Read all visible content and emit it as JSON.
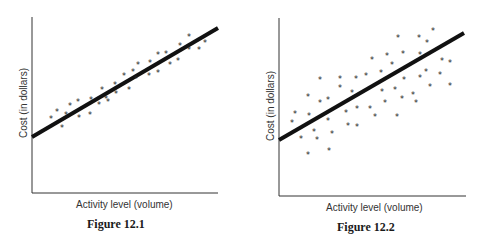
{
  "chart_data": [
    {
      "type": "scatter",
      "title": "Figure 12.1",
      "xlabel": "Activity level (volume)",
      "ylabel": "Cost (in dollars)",
      "grid": false,
      "legend": null,
      "description": "Tightly clustered points around a strong positive linear regression line",
      "regression_line": {
        "x": [
          0,
          100
        ],
        "y": [
          32,
          94
        ]
      },
      "points": [
        {
          "x": 10,
          "y": 43
        },
        {
          "x": 14,
          "y": 47
        },
        {
          "x": 16,
          "y": 38
        },
        {
          "x": 18,
          "y": 45
        },
        {
          "x": 20,
          "y": 50
        },
        {
          "x": 25,
          "y": 52
        },
        {
          "x": 25,
          "y": 43
        },
        {
          "x": 31,
          "y": 45
        },
        {
          "x": 32,
          "y": 53
        },
        {
          "x": 36,
          "y": 51
        },
        {
          "x": 38,
          "y": 59
        },
        {
          "x": 40,
          "y": 54
        },
        {
          "x": 41,
          "y": 52
        },
        {
          "x": 45,
          "y": 62
        },
        {
          "x": 45,
          "y": 57
        },
        {
          "x": 49,
          "y": 67
        },
        {
          "x": 52,
          "y": 59
        },
        {
          "x": 54,
          "y": 69
        },
        {
          "x": 56,
          "y": 65
        },
        {
          "x": 57,
          "y": 73
        },
        {
          "x": 63,
          "y": 67
        },
        {
          "x": 63,
          "y": 74
        },
        {
          "x": 68,
          "y": 68
        },
        {
          "x": 68,
          "y": 79
        },
        {
          "x": 72,
          "y": 79
        },
        {
          "x": 74,
          "y": 73
        },
        {
          "x": 78,
          "y": 76
        },
        {
          "x": 80,
          "y": 84
        },
        {
          "x": 84,
          "y": 82
        },
        {
          "x": 84,
          "y": 89
        },
        {
          "x": 90,
          "y": 82
        },
        {
          "x": 93,
          "y": 86
        }
      ],
      "plot": {
        "origin_px": [
          32,
          193
        ],
        "x_end_px": 218,
        "y_top_px": 17,
        "line_px": [
          [
            32,
            137
          ],
          [
            218,
            28
          ]
        ],
        "stars_px": [
          [
            51,
            118
          ],
          [
            57,
            111
          ],
          [
            62,
            127
          ],
          [
            66,
            114
          ],
          [
            70,
            105
          ],
          [
            78,
            101
          ],
          [
            79,
            117
          ],
          [
            90,
            114
          ],
          [
            91,
            99
          ],
          [
            99,
            104
          ],
          [
            102,
            89
          ],
          [
            106,
            98
          ],
          [
            108,
            101
          ],
          [
            115,
            84
          ],
          [
            116,
            93
          ],
          [
            124,
            75
          ],
          [
            129,
            89
          ],
          [
            133,
            71
          ],
          [
            136,
            78
          ],
          [
            138,
            64
          ],
          [
            149,
            75
          ],
          [
            150,
            62
          ],
          [
            158,
            72
          ],
          [
            158,
            54
          ],
          [
            166,
            53
          ],
          [
            170,
            64
          ],
          [
            178,
            60
          ],
          [
            180,
            45
          ],
          [
            189,
            49
          ],
          [
            189,
            36
          ],
          [
            199,
            49
          ],
          [
            205,
            42
          ]
        ]
      }
    },
    {
      "type": "scatter",
      "title": "Figure 12.2",
      "xlabel": "Activity level (volume)",
      "ylabel": "Cost (in dollars)",
      "grid": false,
      "legend": null,
      "description": "Widely scattered points around a positive linear regression line",
      "regression_line": {
        "x": [
          0,
          100
        ],
        "y": [
          32,
          92
        ]
      },
      "points": [
        {
          "x": 7,
          "y": 42
        },
        {
          "x": 9,
          "y": 47
        },
        {
          "x": 12,
          "y": 33
        },
        {
          "x": 16,
          "y": 57
        },
        {
          "x": 16,
          "y": 46
        },
        {
          "x": 16,
          "y": 24
        },
        {
          "x": 19,
          "y": 37
        },
        {
          "x": 21,
          "y": 32
        },
        {
          "x": 22,
          "y": 66
        },
        {
          "x": 22,
          "y": 53
        },
        {
          "x": 26,
          "y": 55
        },
        {
          "x": 26,
          "y": 43
        },
        {
          "x": 27,
          "y": 26
        },
        {
          "x": 29,
          "y": 35
        },
        {
          "x": 33,
          "y": 66
        },
        {
          "x": 33,
          "y": 61
        },
        {
          "x": 36,
          "y": 47
        },
        {
          "x": 37,
          "y": 40
        },
        {
          "x": 39,
          "y": 58
        },
        {
          "x": 42,
          "y": 66
        },
        {
          "x": 42,
          "y": 49
        },
        {
          "x": 42,
          "y": 39
        },
        {
          "x": 47,
          "y": 68
        },
        {
          "x": 49,
          "y": 49
        },
        {
          "x": 50,
          "y": 77
        },
        {
          "x": 52,
          "y": 45
        },
        {
          "x": 55,
          "y": 70
        },
        {
          "x": 55,
          "y": 59
        },
        {
          "x": 57,
          "y": 53
        },
        {
          "x": 58,
          "y": 79
        },
        {
          "x": 61,
          "y": 74
        },
        {
          "x": 62,
          "y": 60
        },
        {
          "x": 64,
          "y": 45
        },
        {
          "x": 64,
          "y": 89
        },
        {
          "x": 66,
          "y": 55
        },
        {
          "x": 67,
          "y": 80
        },
        {
          "x": 67,
          "y": 66
        },
        {
          "x": 72,
          "y": 57
        },
        {
          "x": 74,
          "y": 53
        },
        {
          "x": 76,
          "y": 89
        },
        {
          "x": 76,
          "y": 80
        },
        {
          "x": 76,
          "y": 67
        },
        {
          "x": 79,
          "y": 70
        },
        {
          "x": 80,
          "y": 86
        },
        {
          "x": 81,
          "y": 62
        },
        {
          "x": 83,
          "y": 93
        },
        {
          "x": 87,
          "y": 69
        },
        {
          "x": 88,
          "y": 76
        },
        {
          "x": 92,
          "y": 75
        },
        {
          "x": 92,
          "y": 62
        }
      ],
      "plot": {
        "origin_px": [
          279,
          196
        ],
        "x_end_px": 466,
        "y_top_px": 18,
        "line_px": [
          [
            279,
            140
          ],
          [
            464,
            33
          ]
        ],
        "stars_px": [
          [
            292,
            122
          ],
          [
            295,
            113
          ],
          [
            301,
            138
          ],
          [
            308,
            96
          ],
          [
            309,
            115
          ],
          [
            308,
            154
          ],
          [
            314,
            131
          ],
          [
            317,
            139
          ],
          [
            320,
            79
          ],
          [
            320,
            102
          ],
          [
            328,
            99
          ],
          [
            328,
            120
          ],
          [
            329,
            150
          ],
          [
            332,
            133
          ],
          [
            340,
            78
          ],
          [
            340,
            87
          ],
          [
            346,
            112
          ],
          [
            348,
            125
          ],
          [
            352,
            92
          ],
          [
            356,
            78
          ],
          [
            357,
            108
          ],
          [
            357,
            126
          ],
          [
            366,
            75
          ],
          [
            370,
            108
          ],
          [
            372,
            59
          ],
          [
            375,
            116
          ],
          [
            381,
            72
          ],
          [
            382,
            91
          ],
          [
            385,
            102
          ],
          [
            387,
            55
          ],
          [
            392,
            64
          ],
          [
            395,
            89
          ],
          [
            397,
            116
          ],
          [
            398,
            37
          ],
          [
            402,
            98
          ],
          [
            403,
            53
          ],
          [
            404,
            79
          ],
          [
            413,
            94
          ],
          [
            416,
            102
          ],
          [
            419,
            37
          ],
          [
            420,
            54
          ],
          [
            420,
            77
          ],
          [
            426,
            71
          ],
          [
            427,
            42
          ],
          [
            430,
            86
          ],
          [
            433,
            30
          ],
          [
            440,
            74
          ],
          [
            442,
            60
          ],
          [
            450,
            62
          ],
          [
            450,
            85
          ]
        ]
      }
    }
  ],
  "figures": {
    "fig1": {
      "caption": "Figure 12.1",
      "xlabel": "Activity level (volume)",
      "ylabel": "Cost (in dollars)"
    },
    "fig2": {
      "caption": "Figure 12.2",
      "xlabel": "Activity level (volume)",
      "ylabel": "Cost (in dollars)"
    }
  },
  "colors": {
    "ink": "#1a1a1a",
    "axis": "#333333",
    "background": "#ffffff"
  },
  "marker_glyph": "*"
}
